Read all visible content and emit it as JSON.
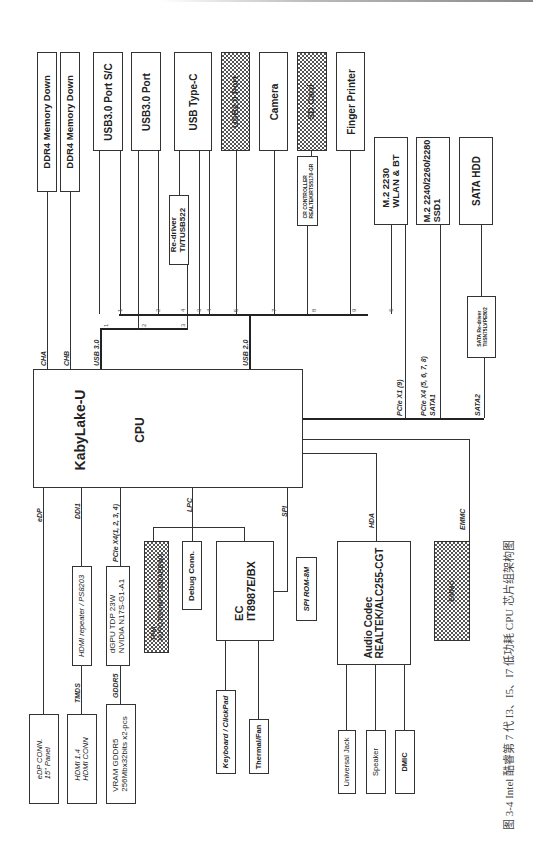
{
  "caption": "图 3-4  Intel 酷睿第 7 代 I3、I5、I7 低功耗 CPU 芯片组架构图",
  "cpu": {
    "line1": "KabyLake-U",
    "line2": "CPU"
  },
  "top_devices": [
    {
      "label": "DDR4 Memory Down"
    },
    {
      "label": "DDR4 Memory Down"
    },
    {
      "label": "USB3.0 Port S/C"
    },
    {
      "label": "USB3.0 Port"
    },
    {
      "label": "USB Type-C"
    },
    {
      "label": "USB2.0 Port"
    },
    {
      "label": "Camera"
    },
    {
      "label": "SD Card"
    },
    {
      "label": "Finger Printer"
    },
    {
      "label": "M.2 2230",
      "label2": "WLAN & BT"
    },
    {
      "label": "M.2 2240/2260/2280",
      "label2": "SSD1"
    },
    {
      "label": "SATA HDD"
    }
  ],
  "redriver": {
    "line1": "Re-driver",
    "line2": "TI/TUSB522"
  },
  "cr_controller": {
    "line1": "CR CONTROLLER",
    "line2": "REALTEK/RTS5170-GR"
  },
  "sata_redriver": {
    "line1": "SATA Re-driver",
    "line2": "TI/SN75LVPE802"
  },
  "bus_labels": {
    "cha": "CHA",
    "chb": "CHB",
    "usb30": "USB 3.0",
    "usb20": "USB 2.0",
    "pcie_x1": "PCIe X1 (9)",
    "pcie_x4": "PCIe X4 (5, 6, 7, 8)",
    "sata1": "SATA1",
    "sata2": "SATA2",
    "edp": "eDP",
    "ddi1": "DDI1",
    "pcie_gpu": "PCIe X4(1, 2, 3, 4)",
    "lpc": "LPC",
    "spi": "SPI",
    "hda": "HDA",
    "emmc": "EMMC",
    "tmds": "TMDS",
    "gddr5": "GDDR5"
  },
  "port_numbers": {
    "usb30": [
      "1",
      "2",
      "3"
    ],
    "usb20": [
      "1",
      "2",
      "4",
      "3",
      "4",
      "5",
      "7",
      "8",
      "9",
      "6"
    ]
  },
  "bottom_devices": {
    "edp_conn": {
      "line1": "eDP CONN.",
      "line2": "15\" Panel"
    },
    "hdmi_conn": {
      "line1": "HDMI 1.4",
      "line2": "HDMI CONN"
    },
    "vram": {
      "line1": "VRAM GDDR5",
      "line2": "256Mbx32bits x2-pcs"
    },
    "hdmi_repeater": "HDMI repeater / PS8203",
    "dgpu": {
      "line1": "dGPU TDP 23W",
      "line2": "NVIDIA N17S-G1-A1"
    },
    "tpm": {
      "line1": "TPM",
      "line2": "NUVOTON/NPCT650ABBWX"
    },
    "debug_conn": "Debug Conn.",
    "ec": {
      "line1": "EC",
      "line2": "IT8987E/BX"
    },
    "spi_rom": "SPI ROM-8M",
    "keyboard": "Keyboard / ClickPad",
    "thermal": "Thermal/Fan",
    "audio": {
      "line1": "Audio Codec",
      "line2": "REALTEK/ALC255-CGT"
    },
    "emmc": "EMMC",
    "universal_jack": "Universal Jack",
    "speaker": "Speaker",
    "dmic": "DMIC"
  }
}
